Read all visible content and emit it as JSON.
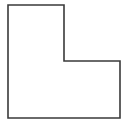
{
  "diagram": {
    "shape": "L-shaped polygon",
    "points": "8,5 64,5 64,61 120,61 120,118 8,118",
    "stroke_color": "#3a3a3a",
    "fill_color": "#ffffff",
    "stroke_width": "1.6"
  }
}
